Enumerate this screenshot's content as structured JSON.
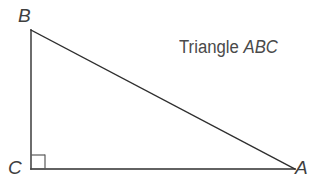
{
  "figure": {
    "caption_prefix": "Triangle ",
    "caption_name": "ABC",
    "background_color": "#ffffff",
    "stroke_color": "#2e2e2e",
    "text_color": "#4a4a4a",
    "label_color": "#3f3f3f"
  },
  "labels": {
    "vertex_b": "B",
    "vertex_c": "C",
    "vertex_a": "A"
  },
  "geometry": {
    "vertices": {
      "B": {
        "x": 31,
        "y": 30
      },
      "C": {
        "x": 31,
        "y": 169
      },
      "A": {
        "x": 295,
        "y": 169
      }
    },
    "right_angle": {
      "at_vertex": "C",
      "marker_size": 14,
      "marker_x": 31,
      "marker_y": 155
    },
    "stroke_width": 1.4
  }
}
